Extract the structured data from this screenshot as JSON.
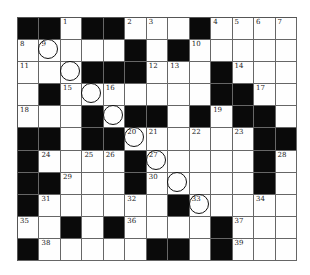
{
  "puzzle": {
    "rows": 11,
    "cols": 13,
    "colors": {
      "block": "#0a0a0a",
      "cell": "#fefefe",
      "line": "#666666"
    },
    "grid": [
      [
        "#",
        "#",
        "1",
        "#",
        "#",
        "2",
        "3",
        ".",
        "#",
        "4",
        "5",
        "6",
        "7"
      ],
      [
        "8",
        "9",
        ".",
        ".",
        ".",
        "#",
        ".",
        "#",
        "10",
        ".",
        ".",
        ".",
        "."
      ],
      [
        "11",
        ".",
        ".",
        "#",
        "#",
        "#",
        "12",
        "13",
        ".",
        "#",
        "14",
        ".",
        "."
      ],
      [
        ".",
        "#",
        "15",
        ".",
        "16",
        ".",
        ".",
        ".",
        ".",
        "#",
        "#",
        "17",
        "."
      ],
      [
        "18",
        ".",
        ".",
        "#",
        ".",
        "#",
        "#",
        ".",
        "#",
        "19",
        "#",
        "#",
        "."
      ],
      [
        "#",
        "#",
        ".",
        "#",
        "#",
        "20",
        "21",
        ".",
        "22",
        ".",
        "23",
        "#",
        "#"
      ],
      [
        "#",
        "24",
        ".",
        "25",
        "26",
        "#",
        "27",
        ".",
        ".",
        ".",
        ".",
        "#",
        "28"
      ],
      [
        "#",
        "#",
        "29",
        ".",
        ".",
        "#",
        "30",
        ".",
        ".",
        ".",
        ".",
        "#",
        "."
      ],
      [
        "#",
        "31",
        ".",
        ".",
        ".",
        "32",
        ".",
        "#",
        "33",
        ".",
        ".",
        "34",
        "."
      ],
      [
        "35",
        ".",
        "#",
        ".",
        "#",
        "36",
        ".",
        ".",
        ".",
        "#",
        "37",
        ".",
        "."
      ],
      [
        "#",
        "38",
        ".",
        ".",
        ".",
        ".",
        "#",
        "#",
        ".",
        "#",
        "39",
        ".",
        "."
      ]
    ],
    "circled_cells": [
      [
        1,
        1
      ],
      [
        2,
        2
      ],
      [
        3,
        3
      ],
      [
        4,
        4
      ],
      [
        5,
        5
      ],
      [
        6,
        6
      ],
      [
        7,
        7
      ],
      [
        8,
        8
      ]
    ]
  }
}
